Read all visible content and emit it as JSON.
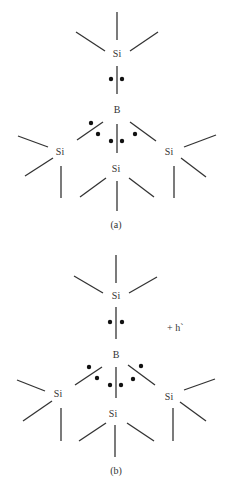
{
  "diagram": {
    "type": "lewis-structure",
    "colors": {
      "ink": "#333333",
      "dot": "#111111",
      "background": "#ffffff"
    },
    "panels": [
      {
        "id": "a",
        "caption": "(a)",
        "atoms": {
          "top_si": "Si",
          "boron": "B",
          "left_si": "Si",
          "middle_si": "Si",
          "right_si": "Si"
        },
        "annotation": ""
      },
      {
        "id": "b",
        "caption": "(b)",
        "atoms": {
          "top_si": "Si",
          "boron": "B",
          "left_si": "Si",
          "middle_si": "Si",
          "right_si": "Si"
        },
        "annotation": "+ h`"
      }
    ]
  }
}
